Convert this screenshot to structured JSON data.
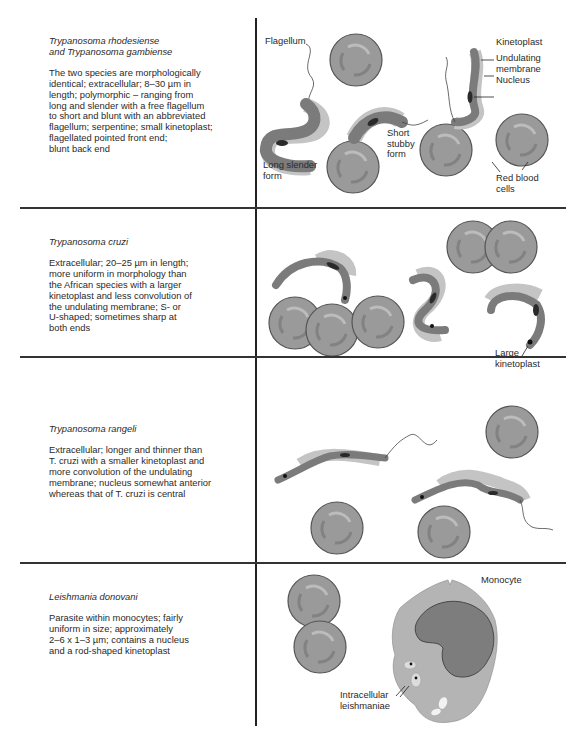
{
  "rows": [
    {
      "title_lines": [
        "Trypanosoma rhodesiense",
        "and Trypanosoma gambiense"
      ],
      "description_lines": [
        "The two species are morphologically",
        "identical; extracellular; 8–30 µm in",
        "length; polymorphic – ranging from",
        "long and slender with a free flagellum",
        "to short and blunt with an abbreviated",
        "flagellum; serpentine; small kinetoplast;",
        "flagellated pointed front end;",
        "blunt back end"
      ],
      "labels": {
        "flagellum": "Flagellum",
        "kinetoplast": "Kinetoplast",
        "undulating_membrane_1": "Undulating",
        "undulating_membrane_2": "membrane",
        "nucleus": "Nucleus",
        "short_stubby_1": "Short",
        "short_stubby_2": "stubby",
        "short_stubby_3": "form",
        "long_slender_1": "Long slender",
        "long_slender_2": "form",
        "rbc_1": "Red blood",
        "rbc_2": "cells"
      }
    },
    {
      "title_lines": [
        "Trypanosoma cruzi"
      ],
      "description_lines": [
        "Extracellular; 20–25 µm in length;",
        "more uniform in morphology than",
        "the African species with a larger",
        "kinetoplast and less convolution of",
        "the undulating membrane; S- or",
        "U-shaped; sometimes sharp at",
        "both ends"
      ],
      "labels": {
        "large_kinetoplast_1": "Large",
        "large_kinetoplast_2": "kinetoplast"
      }
    },
    {
      "title_lines": [
        "Trypanosoma rangeli"
      ],
      "description_lines": [
        "Extracellular; longer and thinner than",
        "T. cruzi with a smaller kinetoplast and",
        "more convolution of the undulating",
        "membrane; nucleus somewhat anterior",
        "whereas that of T. cruzi is central"
      ],
      "labels": {}
    },
    {
      "title_lines": [
        "Leishmania donovani"
      ],
      "description_lines": [
        "Parasite within monocytes; fairly",
        "uniform in size; approximately",
        "2–6 x 1–3 µm; contains a nucleus",
        "and a rod-shaped kinetoplast"
      ],
      "labels": {
        "monocyte": "Monocyte",
        "intracellular_1": "Intracellular",
        "intracellular_2": "leishmaniae"
      }
    }
  ],
  "colors": {
    "rbc_fill": "#9a9a9a",
    "rbc_stroke": "#555555",
    "rbc_pallor": "#bdbdbd",
    "parasite_body": "#7b7b7b",
    "membrane": "#c4c4c4",
    "nucleus": "#2a2a2a",
    "monocyte_cytoplasm": "#b4b4b4",
    "monocyte_nucleus": "#7d7d7d",
    "line": "#222222"
  }
}
